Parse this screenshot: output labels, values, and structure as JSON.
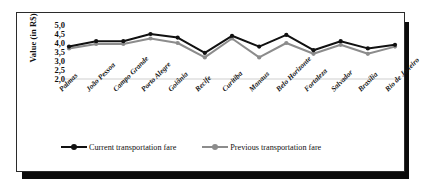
{
  "chart_data": {
    "type": "line",
    "title": "",
    "xlabel": "",
    "ylabel": "Value (in R$)",
    "ylim": [
      2.0,
      5.0
    ],
    "yticks": [
      "5,0",
      "4,5",
      "4,0",
      "3,5",
      "3,0",
      "2,5",
      "2,0"
    ],
    "ytick_values": [
      5.0,
      4.5,
      4.0,
      3.5,
      3.0,
      2.5,
      2.0
    ],
    "grid": "baseline-only",
    "legend_position": "bottom",
    "decimal_separator": ",",
    "categories": [
      "Palmas",
      "João Pessoa",
      "Campo Grande",
      "Porto Alegre",
      "Goiânia",
      "Recife",
      "Curitiba",
      "Manaus",
      "Belo Horizonte",
      "Fortaleza",
      "Salvador",
      "Brasília",
      "Rio de Janeiro"
    ],
    "series": [
      {
        "name": "Current transportation fare",
        "color": "#111111",
        "values": [
          3.8,
          4.1,
          4.1,
          4.5,
          4.3,
          3.45,
          4.4,
          3.8,
          4.45,
          3.6,
          4.1,
          3.7,
          3.9
        ]
      },
      {
        "name": "Previous transportation fare",
        "color": "#8c8c8c",
        "values": [
          3.7,
          3.95,
          3.95,
          4.25,
          4.0,
          3.2,
          4.25,
          3.2,
          4.0,
          3.4,
          3.9,
          3.4,
          3.8
        ]
      }
    ]
  },
  "legend": {
    "entries": [
      {
        "label": "Current transportation fare",
        "color": "#111111"
      },
      {
        "label": "Previous transportation fare",
        "color": "#8c8c8c"
      }
    ]
  },
  "colors": {
    "current_series": "#111111",
    "previous_series": "#8c8c8c",
    "frame_border": "#2b2b2b",
    "shadow": "#0b0b0b",
    "gridline": "#cfcfcf",
    "background": "#ffffff"
  }
}
